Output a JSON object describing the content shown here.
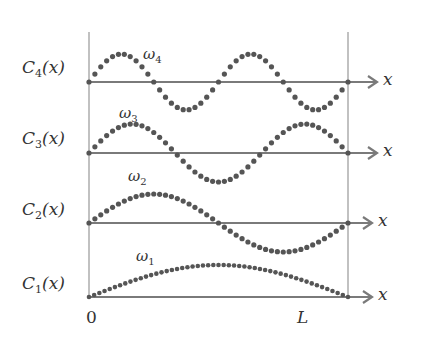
{
  "diagram": {
    "title": "",
    "colors": {
      "dots": "#555555",
      "axis": "#7a7a7a",
      "boundary": "#a0a0a0",
      "text": "#333333"
    },
    "x_range": {
      "start_label": "0",
      "end_label": "L"
    },
    "axis_label": "x",
    "modes": [
      {
        "id": 1,
        "label_main": "C",
        "label_sub": "1",
        "label_tail": "(x)",
        "omega_main": "ω",
        "omega_sub": "1",
        "half_waves": 1
      },
      {
        "id": 2,
        "label_main": "C",
        "label_sub": "2",
        "label_tail": "(x)",
        "omega_main": "ω",
        "omega_sub": "2",
        "half_waves": 2
      },
      {
        "id": 3,
        "label_main": "C",
        "label_sub": "3",
        "label_tail": "(x)",
        "omega_main": "ω",
        "omega_sub": "3",
        "half_waves": 3
      },
      {
        "id": 4,
        "label_main": "C",
        "label_sub": "4",
        "label_tail": "(x)",
        "omega_main": "ω",
        "omega_sub": "4",
        "half_waves": 4
      }
    ]
  }
}
